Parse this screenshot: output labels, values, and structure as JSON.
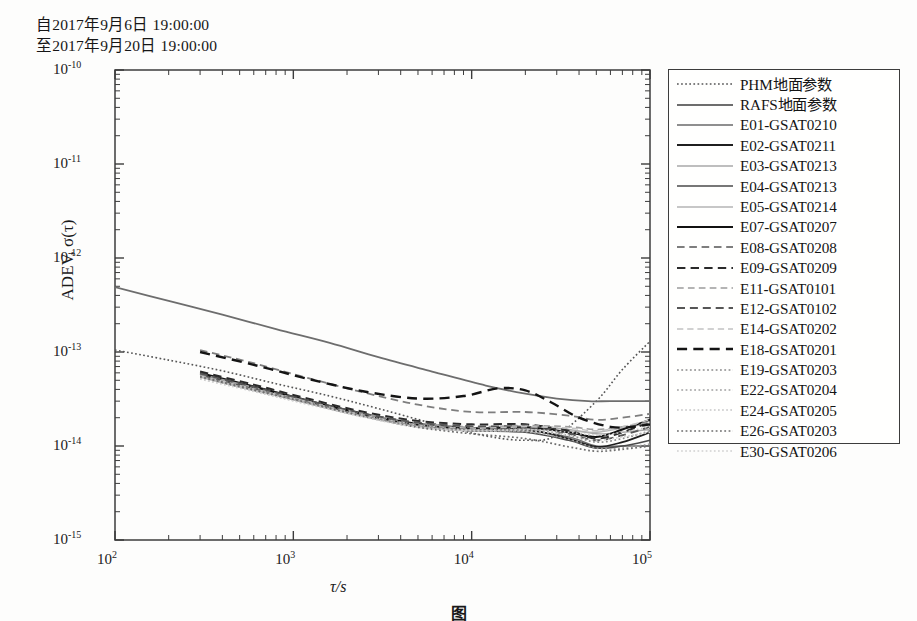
{
  "header": {
    "from_line": "自2017年9月6日 19:00:00",
    "to_line": "至2017年9月20日 19:00:00"
  },
  "caption": {
    "text": "图"
  },
  "axes": {
    "ylabel": "ADEV, σ(τ)",
    "xlabel": "τ/s",
    "xticks": [
      "10",
      "10",
      "10",
      "10"
    ],
    "xtick_exp": [
      "2",
      "3",
      "4",
      "5"
    ],
    "yticks": [
      "10",
      "10",
      "10",
      "10",
      "10",
      "10"
    ],
    "ytick_exp": [
      "-10",
      "-11",
      "-12",
      "-13",
      "-14",
      "-15"
    ]
  },
  "colors": {
    "frame": "#3c3c3c",
    "dark": "#1c1c1c",
    "mid": "#5a5a5a",
    "light": "#9a9a9a",
    "pale": "#bcbcbc"
  },
  "chart_data": {
    "type": "line",
    "title": "",
    "xlabel": "τ/s",
    "ylabel": "ADEV, σ(τ)",
    "xscale": "log",
    "yscale": "log",
    "xlim": [
      100,
      100000
    ],
    "ylim": [
      1e-15,
      1e-10
    ],
    "grid": false,
    "legend_position": "right-outside",
    "x_tick_values": [
      100,
      1000,
      10000,
      100000
    ],
    "y_tick_values": [
      1e-10,
      1e-11,
      1e-12,
      1e-13,
      1e-14,
      1e-15
    ],
    "annotations": [
      "自2017年9月6日 19:00:00",
      "至2017年9月20日 19:00:00"
    ],
    "series": [
      {
        "name": "PHM地面参数",
        "style": "dotted",
        "color": "#555555",
        "width": 1.6,
        "x": [
          100,
          200,
          400,
          800,
          1600,
          3000,
          6000,
          12000,
          20000,
          30000,
          50000,
          70000,
          100000
        ],
        "y": [
          1.05e-13,
          8.2e-14,
          6.3e-14,
          4.6e-14,
          3.4e-14,
          2.5e-14,
          1.75e-14,
          1.28e-14,
          1.15e-14,
          1.3e-14,
          3e-14,
          6.5e-14,
          1.3e-13
        ]
      },
      {
        "name": "RAFS地面参数",
        "style": "solid",
        "color": "#6d6d6d",
        "width": 1.8,
        "x": [
          100,
          200,
          400,
          800,
          1600,
          3000,
          6000,
          12000,
          20000,
          30000,
          45000,
          60000,
          100000
        ],
        "y": [
          4.9e-13,
          3.5e-13,
          2.5e-13,
          1.75e-13,
          1.25e-13,
          8.8e-14,
          6.2e-14,
          4.4e-14,
          3.6e-14,
          3.2e-14,
          3e-14,
          3e-14,
          3e-14
        ]
      },
      {
        "name": "E01-GSAT0210",
        "style": "solid",
        "color": "#6a6a6a",
        "width": 1.5,
        "x": [
          300,
          600,
          1200,
          2500,
          5000,
          10000,
          20000,
          35000,
          50000,
          70000,
          100000
        ],
        "y": [
          5.6e-14,
          4e-14,
          2.9e-14,
          2.1e-14,
          1.65e-14,
          1.45e-14,
          1.45e-14,
          1.25e-14,
          1e-14,
          1e-14,
          1e-14
        ]
      },
      {
        "name": "E02-GSAT0211",
        "style": "solid",
        "color": "#1f1f1f",
        "width": 1.8,
        "x": [
          300,
          600,
          1200,
          2500,
          5000,
          10000,
          20000,
          35000,
          50000,
          70000,
          100000
        ],
        "y": [
          5.9e-14,
          4.2e-14,
          3e-14,
          2.15e-14,
          1.7e-14,
          1.5e-14,
          1.5e-14,
          1.2e-14,
          9.8e-15,
          1.1e-14,
          1.4e-14
        ]
      },
      {
        "name": "E03-GSAT0213",
        "style": "solid",
        "color": "#a8a8a8",
        "width": 1.4,
        "x": [
          300,
          600,
          1200,
          2500,
          5000,
          10000,
          20000,
          35000,
          50000,
          70000,
          100000
        ],
        "y": [
          5.4e-14,
          3.9e-14,
          2.85e-14,
          2.05e-14,
          1.6e-14,
          1.5e-14,
          1.6e-14,
          1.5e-14,
          1.35e-14,
          1.4e-14,
          1.5e-14
        ]
      },
      {
        "name": "E04-GSAT0213",
        "style": "solid",
        "color": "#4a4a4a",
        "width": 1.6,
        "x": [
          300,
          600,
          1200,
          2500,
          5000,
          10000,
          20000,
          35000,
          50000,
          70000,
          100000
        ],
        "y": [
          5.7e-14,
          4.1e-14,
          2.95e-14,
          2.1e-14,
          1.62e-14,
          1.45e-14,
          1.4e-14,
          1.15e-14,
          9.5e-15,
          1e-14,
          1.15e-14
        ]
      },
      {
        "name": "E05-GSAT0214",
        "style": "solid",
        "color": "#b4b4b4",
        "width": 1.4,
        "x": [
          300,
          600,
          1200,
          2500,
          5000,
          10000,
          20000,
          35000,
          50000,
          70000,
          100000
        ],
        "y": [
          5.5e-14,
          3.95e-14,
          2.85e-14,
          2.05e-14,
          1.6e-14,
          1.45e-14,
          1.5e-14,
          1.45e-14,
          1.4e-14,
          1.55e-14,
          1.75e-14
        ]
      },
      {
        "name": "E07-GSAT0207",
        "style": "solid",
        "color": "#111111",
        "width": 2.0,
        "x": [
          300,
          600,
          1200,
          2500,
          5000,
          10000,
          20000,
          35000,
          50000,
          70000,
          100000
        ],
        "y": [
          6e-14,
          4.3e-14,
          3.05e-14,
          2.2e-14,
          1.72e-14,
          1.55e-14,
          1.58e-14,
          1.4e-14,
          1.25e-14,
          1.5e-14,
          1.9e-14
        ]
      },
      {
        "name": "E08-GSAT0208",
        "style": "dashed",
        "color": "#7e7e7e",
        "width": 1.8,
        "x": [
          300,
          600,
          1200,
          2500,
          5000,
          10000,
          20000,
          35000,
          50000,
          70000,
          100000
        ],
        "y": [
          1.05e-13,
          7.6e-14,
          5.3e-14,
          3.7e-14,
          2.75e-14,
          2.3e-14,
          2.3e-14,
          2.1e-14,
          1.9e-14,
          2e-14,
          2.2e-14
        ]
      },
      {
        "name": "E09-GSAT0209",
        "style": "dashed",
        "color": "#2a2a2a",
        "width": 2.0,
        "x": [
          300,
          600,
          1200,
          2500,
          5000,
          10000,
          20000,
          35000,
          50000,
          70000,
          100000
        ],
        "y": [
          6.2e-14,
          4.5e-14,
          3.2e-14,
          2.3e-14,
          1.85e-14,
          1.7e-14,
          1.7e-14,
          1.45e-14,
          1.2e-14,
          1.4e-14,
          1.8e-14
        ]
      },
      {
        "name": "E11-GSAT0101",
        "style": "dashed",
        "color": "#9c9c9c",
        "width": 1.6,
        "x": [
          300,
          600,
          1200,
          2500,
          5000,
          10000,
          20000,
          35000,
          50000,
          70000,
          100000
        ],
        "y": [
          5.8e-14,
          4.2e-14,
          3e-14,
          2.2e-14,
          1.75e-14,
          1.6e-14,
          1.65e-14,
          1.6e-14,
          1.5e-14,
          1.6e-14,
          1.8e-14
        ]
      },
      {
        "name": "E12-GSAT0102",
        "style": "dashed",
        "color": "#565656",
        "width": 1.9,
        "x": [
          300,
          600,
          1200,
          2500,
          5000,
          10000,
          20000,
          35000,
          50000,
          70000,
          100000
        ],
        "y": [
          5.9e-14,
          4.25e-14,
          3.05e-14,
          2.2e-14,
          1.78e-14,
          1.62e-14,
          1.6e-14,
          1.35e-14,
          1.15e-14,
          1.3e-14,
          1.6e-14
        ]
      },
      {
        "name": "E14-GSAT0202",
        "style": "dashed",
        "color": "#c2c2c2",
        "width": 1.5,
        "x": [
          300,
          600,
          1200,
          2500,
          5000,
          10000,
          20000,
          35000,
          50000,
          70000,
          100000
        ],
        "y": [
          5.6e-14,
          4.05e-14,
          2.95e-14,
          2.12e-14,
          1.68e-14,
          1.55e-14,
          1.6e-14,
          1.55e-14,
          1.45e-14,
          1.6e-14,
          1.9e-14
        ]
      },
      {
        "name": "E18-GSAT0201",
        "style": "dashed",
        "color": "#141414",
        "width": 2.4,
        "x": [
          300,
          600,
          1200,
          2500,
          5000,
          9000,
          14000,
          20000,
          28000,
          40000,
          60000,
          80000,
          100000
        ],
        "y": [
          1e-13,
          7.3e-14,
          5.2e-14,
          3.8e-14,
          3.2e-14,
          3.4e-14,
          4.1e-14,
          3.9e-14,
          2.9e-14,
          2e-14,
          1.6e-14,
          1.6e-14,
          1.7e-14
        ]
      },
      {
        "name": "E19-GSAT0203",
        "style": "dotted",
        "color": "#8a8a8a",
        "width": 1.7,
        "x": [
          300,
          600,
          1200,
          2500,
          5000,
          10000,
          20000,
          35000,
          50000,
          70000,
          100000
        ],
        "y": [
          5.5e-14,
          4e-14,
          2.9e-14,
          2.1e-14,
          1.68e-14,
          1.5e-14,
          1.5e-14,
          1.3e-14,
          1.1e-14,
          1.2e-14,
          1.45e-14
        ]
      },
      {
        "name": "E22-GSAT0204",
        "style": "dotted",
        "color": "#a0a0a0",
        "width": 1.7,
        "x": [
          300,
          600,
          1200,
          2500,
          5000,
          10000,
          20000,
          35000,
          50000,
          70000,
          100000
        ],
        "y": [
          5.3e-14,
          3.9e-14,
          2.85e-14,
          2.08e-14,
          1.62e-14,
          1.45e-14,
          1.42e-14,
          1.18e-14,
          9.5e-15,
          9.5e-15,
          1.05e-14
        ]
      },
      {
        "name": "E24-GSAT0205",
        "style": "dotted",
        "color": "#c6c6c6",
        "width": 1.6,
        "x": [
          300,
          600,
          1200,
          2500,
          5000,
          10000,
          20000,
          35000,
          50000,
          70000,
          100000
        ],
        "y": [
          5.2e-14,
          3.85e-14,
          2.8e-14,
          2.05e-14,
          1.6e-14,
          1.48e-14,
          1.5e-14,
          1.4e-14,
          1.3e-14,
          1.4e-14,
          1.6e-14
        ]
      },
      {
        "name": "E26-GSAT0203",
        "style": "dotted",
        "color": "#6e6e6e",
        "width": 1.7,
        "x": [
          300,
          600,
          1200,
          2500,
          5000,
          10000,
          20000,
          35000,
          50000,
          70000,
          100000
        ],
        "y": [
          5.45e-14,
          3.95e-14,
          2.88e-14,
          2.06e-14,
          1.58e-14,
          1.35e-14,
          1.2e-14,
          9.8e-15,
          8.8e-15,
          9.2e-15,
          1e-14
        ]
      },
      {
        "name": "E30-GSAT0206",
        "style": "dotted",
        "color": "#d0d0d0",
        "width": 1.6,
        "x": [
          300,
          600,
          1200,
          2500,
          5000,
          10000,
          20000,
          35000,
          50000,
          70000,
          100000
        ],
        "y": [
          5.15e-14,
          3.8e-14,
          2.78e-14,
          2.02e-14,
          1.58e-14,
          1.45e-14,
          1.45e-14,
          1.3e-14,
          1.15e-14,
          1.25e-14,
          1.4e-14
        ]
      }
    ]
  }
}
